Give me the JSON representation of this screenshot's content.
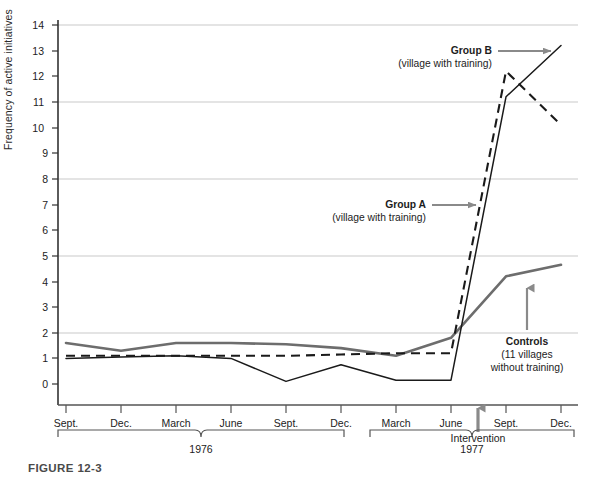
{
  "figure": {
    "caption": "FIGURE 12-3"
  },
  "axes": {
    "ylabel": "Frequency of active initiatives",
    "yticks": [
      "0",
      "1",
      "2",
      "3",
      "4",
      "5",
      "6",
      "7",
      "8",
      "9",
      "10",
      "11",
      "12",
      "13",
      "14"
    ],
    "xticks": [
      "Sept.",
      "Dec.",
      "March",
      "June",
      "Sept.",
      "Dec.",
      "March",
      "June",
      "Sept.",
      "Dec."
    ],
    "year_left": "1976",
    "year_right": "1977",
    "intervention_label": "Intervention"
  },
  "annotations": {
    "group_b": {
      "title": "Group B",
      "subtitle": "(village with training)"
    },
    "group_a": {
      "title": "Group A",
      "subtitle": "(village with training)"
    },
    "controls": {
      "title": "Controls",
      "line1": "(11 villages",
      "line2": "without training)"
    }
  },
  "colors": {
    "controls": "#6d6d6d",
    "group_a": "#1a1a1a",
    "group_b": "#1a1a1a",
    "grid": "#c8c8c8",
    "axis": "#333333",
    "arrow": "#8a8a8a",
    "caption": "#4a4a4a"
  },
  "chart_data": {
    "type": "line",
    "title": "FIGURE 12-3",
    "xlabel": "",
    "ylabel": "Frequency of active initiatives",
    "ylim": [
      0,
      14
    ],
    "yticks": [
      0,
      1,
      2,
      3,
      4,
      5,
      6,
      7,
      8,
      9,
      10,
      11,
      12,
      13,
      14
    ],
    "gridlines_y": [
      2,
      5,
      8,
      11,
      14
    ],
    "grid": true,
    "legend": "annotated-inline",
    "categories": [
      "Sept. 1976",
      "Dec. 1976",
      "March 1976",
      "June 1976",
      "Sept. 1976",
      "Dec. 1976",
      "March 1977",
      "June 1977",
      "Sept. 1977",
      "Dec. 1977"
    ],
    "x": [
      "Sept.",
      "Dec.",
      "March",
      "June",
      "Sept.",
      "Dec.",
      "March",
      "June",
      "Sept.",
      "Dec."
    ],
    "intervention_between": [
      "June 1977",
      "Sept. 1977"
    ],
    "series": [
      {
        "name": "Controls (11 villages without training)",
        "style": "solid-thick-gray",
        "color": "#6d6d6d",
        "values": [
          1.6,
          1.3,
          1.6,
          1.6,
          1.55,
          1.4,
          1.1,
          1.8,
          1.25,
          1.2
        ]
      },
      {
        "name": "Group A (village with training)",
        "style": "dashed-black",
        "color": "#1a1a1a",
        "values": [
          1.1,
          1.1,
          1.1,
          1.1,
          1.1,
          1.15,
          1.2,
          1.2,
          1.2,
          1.25
        ]
      },
      {
        "name": "Group B (village with training)",
        "style": "solid-thin-black",
        "color": "#1a1a1a",
        "values": [
          1.0,
          1.05,
          1.1,
          1.0,
          0.1,
          0.75,
          0.15,
          0.15,
          0.8,
          0.2
        ]
      }
    ],
    "note": "Three overlapping traces; after the Intervention (between June and Sept. 1977) Group A rises to 12.2 then falls to 10.1, Group B rises to 11.2 then to 13.2, Controls rise to 4.2 then 4.65."
  }
}
